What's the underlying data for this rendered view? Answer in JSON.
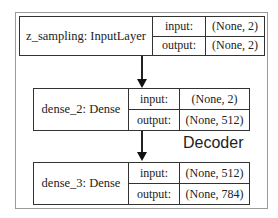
{
  "diagram": {
    "title": "Decoder",
    "nodes": [
      {
        "label": "z_sampling: InputLayer",
        "input_key": "input:",
        "input_val": "(None, 2)",
        "output_key": "output:",
        "output_val": "(None, 2)"
      },
      {
        "label": "dense_2: Dense",
        "input_key": "input:",
        "input_val": "(None, 2)",
        "output_key": "output:",
        "output_val": "(None, 512)"
      },
      {
        "label": "dense_3: Dense",
        "input_key": "input:",
        "input_val": "(None, 512)",
        "output_key": "output:",
        "output_val": "(None, 784)"
      }
    ],
    "edges": [
      {
        "from": "z_sampling: InputLayer",
        "to": "dense_2: Dense"
      },
      {
        "from": "dense_2: Dense",
        "to": "dense_3: Dense"
      }
    ]
  }
}
